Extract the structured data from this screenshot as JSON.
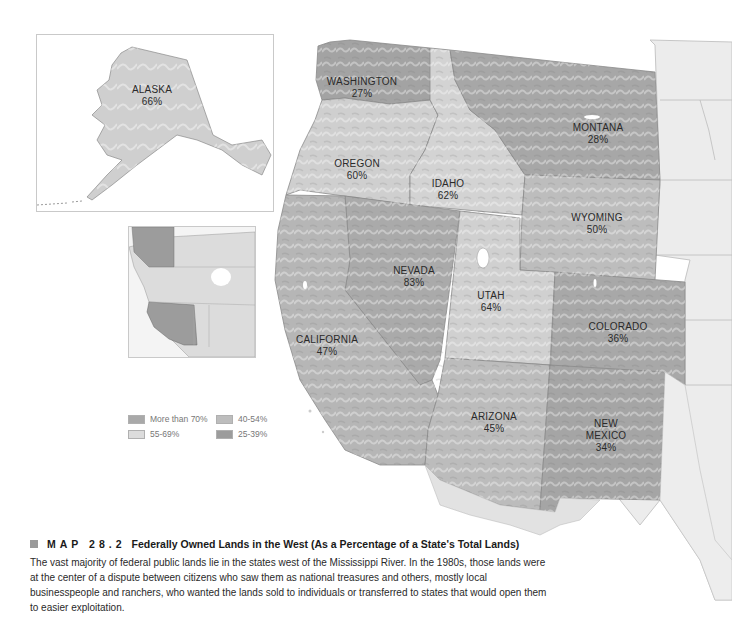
{
  "map": {
    "title_prefix": "MAP 28.2",
    "title": "Federally Owned Lands in the West (As a Percentage of a State's Total Lands)",
    "caption": "The vast majority of federal public lands lie in the states west of the Mississippi River. In the 1980s, those lands were at the center of a dispute between citizens who saw them as national treasures and others, mostly local businesspeople and ranchers, who wanted the lands sold to individuals or transferred to states that would open them to easier exploitation."
  },
  "states": {
    "alaska": {
      "name": "ALASKA",
      "pct": "66%"
    },
    "washington": {
      "name": "WASHINGTON",
      "pct": "27%"
    },
    "montana": {
      "name": "MONTANA",
      "pct": "28%"
    },
    "oregon": {
      "name": "OREGON",
      "pct": "60%"
    },
    "idaho": {
      "name": "IDAHO",
      "pct": "62%"
    },
    "wyoming": {
      "name": "WYOMING",
      "pct": "50%"
    },
    "nevada": {
      "name": "NEVADA",
      "pct": "83%"
    },
    "utah": {
      "name": "UTAH",
      "pct": "64%"
    },
    "colorado": {
      "name": "COLORADO",
      "pct": "36%"
    },
    "california": {
      "name": "CALIFORNIA",
      "pct": "47%"
    },
    "arizona": {
      "name": "ARIZONA",
      "pct": "45%"
    },
    "new_mexico": {
      "name_line1": "NEW",
      "name_line2": "MEXICO",
      "pct": "34%"
    }
  },
  "legend": {
    "items": [
      {
        "label": "More than 70%",
        "color": "#a9a9a9"
      },
      {
        "label": "55-69%",
        "color": "#dcdcdc"
      },
      {
        "label": "40-54%",
        "color": "#bdbdbd"
      },
      {
        "label": "25-39%",
        "color": "#9c9c9c"
      }
    ]
  },
  "colors": {
    "state_fill_gt70": "#a9a9a9",
    "state_fill_55_69": "#d2d2d2",
    "state_fill_40_54": "#bdbdbd",
    "state_fill_25_39": "#a3a3a3",
    "outside_land": "#ececec",
    "border": "#8a8a8a"
  }
}
